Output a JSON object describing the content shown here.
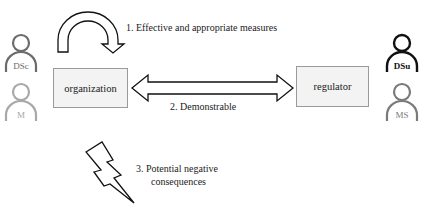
{
  "diagram": {
    "nodes": {
      "organization": {
        "label": "organization"
      },
      "regulator": {
        "label": "regulator"
      }
    },
    "actors": {
      "left_top": {
        "label": "DSc",
        "color": "#6b6b6b"
      },
      "left_bottom": {
        "label": "M",
        "color": "#a8a8a8"
      },
      "right_top": {
        "label": "DSu",
        "color": "#111111"
      },
      "right_bottom": {
        "label": "MS",
        "color": "#7a7a7a"
      }
    },
    "edges": {
      "self_loop": {
        "label": "1. Effective and appropriate measures"
      },
      "bidirectional": {
        "label": "2. Demonstrable"
      },
      "lightning": {
        "line1": "3. Potential negative",
        "line2": "consequences"
      }
    },
    "colors": {
      "box_fill": "#f3f3f3",
      "box_border": "#9a9a9a",
      "arrow_stroke": "#111111",
      "text": "#222222"
    }
  }
}
